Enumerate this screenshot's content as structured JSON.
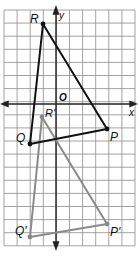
{
  "diagram": {
    "type": "coordinate-plane-translation",
    "axes": {
      "x_label": "x",
      "y_label": "y",
      "origin_label": "O"
    },
    "grid": {
      "x0": 4,
      "y0": 10,
      "cell": 13.1,
      "cols": 10,
      "rows": 18,
      "origin_px": [
        56,
        104
      ],
      "line_color": "#8c8c8c"
    },
    "original_triangle": {
      "color": "#111111",
      "vertices": [
        {
          "name": "R",
          "label": "R",
          "px": [
            43,
            24
          ]
        },
        {
          "name": "P",
          "label": "P",
          "px": [
            107,
            129
          ]
        },
        {
          "name": "Q",
          "label": "Q",
          "px": [
            30,
            144
          ]
        }
      ]
    },
    "image_triangle": {
      "color": "#8a8a8a",
      "vertices": [
        {
          "name": "R'",
          "label": "R'",
          "px": [
            42,
            117
          ]
        },
        {
          "name": "P'",
          "label": "P'",
          "px": [
            107,
            224
          ]
        },
        {
          "name": "Q'",
          "label": "Q'",
          "px": [
            30,
            237
          ]
        }
      ]
    }
  }
}
